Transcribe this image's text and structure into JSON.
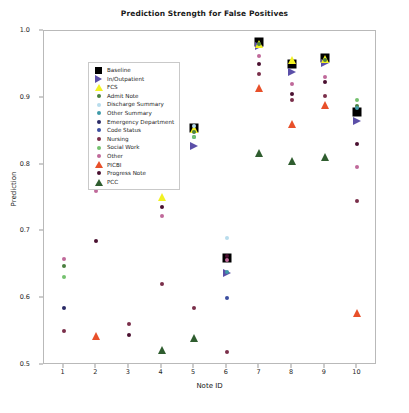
{
  "chart_data": {
    "type": "scatter",
    "title": "Prediction Strength for False Positives",
    "xlabel": "Note ID",
    "ylabel": "Prediction",
    "xlim": [
      0.4,
      10.6
    ],
    "ylim": [
      0.5,
      1.0
    ],
    "xticks": [
      "1",
      "2",
      "3",
      "4",
      "5",
      "6",
      "7",
      "8",
      "9",
      "10"
    ],
    "yticks": [
      "0.5",
      "0.6",
      "0.7",
      "0.8",
      "0.9",
      "1.0"
    ],
    "grid": false,
    "legend_position": "upper left",
    "x": [
      1,
      2,
      3,
      4,
      5,
      6,
      7,
      8,
      9,
      10
    ],
    "series": [
      {
        "name": "Baseline",
        "color": "#000000",
        "marker": "square",
        "size": 9,
        "values": [
          null,
          0.806,
          null,
          0.822,
          0.855,
          0.66,
          0.983,
          0.95,
          0.96,
          0.878
        ]
      },
      {
        "name": "In/Outpatient",
        "color": "#5b4fa8",
        "marker": "right-triangle",
        "size": 8,
        "values": [
          null,
          0.778,
          null,
          0.789,
          0.828,
          0.638,
          0.977,
          0.938,
          0.952,
          0.865
        ]
      },
      {
        "name": "FCS",
        "color": "#f2f222",
        "marker": "triangle",
        "size": 8,
        "values": [
          null,
          0.774,
          null,
          0.751,
          0.854,
          null,
          0.98,
          0.957,
          0.958,
          null
        ]
      },
      {
        "name": "Admit Note",
        "color": "#4a7f3f",
        "marker": "circle",
        "size": 4,
        "values": [
          0.648,
          0.8,
          null,
          null,
          0.849,
          null,
          0.981,
          null,
          0.957,
          0.888
        ]
      },
      {
        "name": "Discharge Summary",
        "color": "#b8dcec",
        "marker": "circle",
        "size": 4,
        "values": [
          null,
          0.797,
          null,
          null,
          0.858,
          0.69,
          null,
          null,
          null,
          null
        ]
      },
      {
        "name": "Other Summary",
        "color": "#3f9aa8",
        "marker": "circle",
        "size": 4,
        "values": [
          null,
          0.793,
          null,
          0.806,
          0.841,
          0.639,
          null,
          null,
          null,
          0.884
        ]
      },
      {
        "name": "Emergency Department",
        "color": "#2a2a66",
        "marker": "circle",
        "size": 4,
        "values": [
          0.586,
          0.805,
          null,
          0.795,
          null,
          null,
          null,
          null,
          null,
          null
        ]
      },
      {
        "name": "Code Status",
        "color": "#3c4fa0",
        "marker": "circle",
        "size": 4,
        "values": [
          null,
          null,
          null,
          null,
          null,
          0.6,
          null,
          null,
          null,
          null
        ]
      },
      {
        "name": "Nursing",
        "color": "#7a2f4a",
        "marker": "circle",
        "size": 4,
        "values": [
          0.551,
          0.788,
          0.561,
          0.622,
          0.586,
          0.52,
          0.936,
          0.896,
          0.903,
          0.745
        ]
      },
      {
        "name": "Social Work",
        "color": "#74c16e",
        "marker": "circle",
        "size": 4,
        "values": [
          0.632,
          0.789,
          null,
          null,
          0.841,
          null,
          null,
          null,
          null,
          0.897
        ]
      },
      {
        "name": "Other",
        "color": "#c0699a",
        "marker": "circle",
        "size": 4,
        "values": [
          0.658,
          0.76,
          null,
          0.723,
          null,
          0.657,
          0.962,
          0.92,
          0.931,
          0.796
        ]
      },
      {
        "name": "PICBI",
        "color": "#e8502a",
        "marker": "triangle",
        "size": 8,
        "values": [
          null,
          0.543,
          null,
          null,
          null,
          null,
          0.915,
          0.861,
          0.889,
          0.578
        ]
      },
      {
        "name": "Progress Note",
        "color": "#4a1030",
        "marker": "circle",
        "size": 4,
        "values": [
          null,
          0.686,
          0.545,
          0.737,
          null,
          0.663,
          0.951,
          0.906,
          0.923,
          0.831
        ]
      },
      {
        "name": "PCC",
        "color": "#2f5d2f",
        "marker": "triangle",
        "size": 8,
        "values": [
          null,
          null,
          null,
          0.522,
          0.541,
          null,
          0.818,
          0.806,
          0.812,
          null
        ]
      }
    ]
  }
}
